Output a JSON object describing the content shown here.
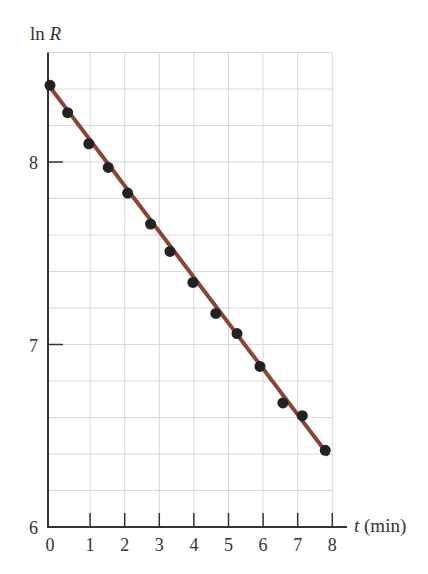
{
  "chart_data": {
    "type": "scatter",
    "title": "",
    "xlabel": "t (min)",
    "xlabel_var": "t",
    "xlabel_unit": "(min)",
    "ylabel": "ln R",
    "ylabel_fn": "ln",
    "ylabel_var": "R",
    "xlim": [
      0,
      8
    ],
    "ylim": [
      6,
      8.6
    ],
    "x_ticks": [
      0,
      1,
      2,
      3,
      4,
      5,
      6,
      7,
      8
    ],
    "y_ticks": [
      6,
      7,
      8
    ],
    "grid": true,
    "legend": null,
    "series": [
      {
        "name": "data",
        "kind": "points",
        "x": [
          0,
          0.5,
          1.1,
          1.65,
          2.2,
          2.85,
          3.4,
          4.05,
          4.7,
          5.3,
          5.95,
          6.6,
          7.15,
          7.8
        ],
        "y": [
          8.42,
          8.27,
          8.1,
          7.97,
          7.83,
          7.66,
          7.51,
          7.34,
          7.17,
          7.06,
          6.88,
          6.68,
          6.61,
          6.42
        ]
      },
      {
        "name": "fit",
        "kind": "line",
        "x": [
          0,
          7.8
        ],
        "y": [
          8.42,
          6.41
        ]
      }
    ],
    "colors": {
      "line": "#8b4433",
      "points": "#222222",
      "axis": "#333333",
      "grid": "#d8d8d8"
    }
  }
}
